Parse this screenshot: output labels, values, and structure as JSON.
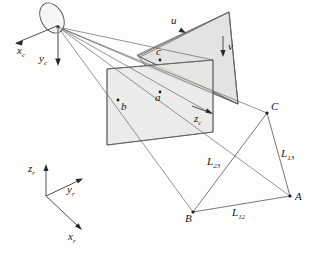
{
  "figure": {
    "background_color": "#fdfdfc",
    "line_color": "#57575d",
    "plane_fill_color": "#e2e2e0",
    "label_color": "#16161a"
  },
  "camera": {
    "lens_name": "camera-lens",
    "center_name": "camera-optical-center",
    "axes": [
      {
        "id": "xc",
        "base": "x",
        "sub": "c",
        "direction": "down-left"
      },
      {
        "id": "yc",
        "base": "y",
        "sub": "c",
        "direction": "down"
      },
      {
        "id": "zc",
        "base": "z",
        "sub": "c",
        "direction": "down-right"
      }
    ]
  },
  "image_plane": {
    "name": "image-plane",
    "axes": [
      {
        "id": "u",
        "base": "u",
        "sub": "",
        "direction": "down-right"
      },
      {
        "id": "v",
        "base": "v",
        "sub": "",
        "direction": "down"
      }
    ]
  },
  "projected_points": [
    {
      "id": "a",
      "label": "a",
      "plane": "near-plane"
    },
    {
      "id": "b",
      "label": "b",
      "plane": "near-plane"
    },
    {
      "id": "c",
      "label": "c",
      "plane": "near-plane"
    }
  ],
  "world_points": [
    {
      "id": "A",
      "label": "A"
    },
    {
      "id": "B",
      "label": "B"
    },
    {
      "id": "C",
      "label": "C"
    }
  ],
  "distances": [
    {
      "id": "L12",
      "base": "L",
      "sub": "12",
      "between": "B-A"
    },
    {
      "id": "L13",
      "base": "L",
      "sub": "13",
      "between": "C-A"
    },
    {
      "id": "L23",
      "base": "L",
      "sub": "23",
      "between": "B-C"
    }
  ],
  "world_frame": {
    "name": "world-reference-frame",
    "axes": [
      {
        "id": "xr",
        "base": "x",
        "sub": "r",
        "direction": "down-right"
      },
      {
        "id": "yr",
        "base": "y",
        "sub": "r",
        "direction": "up-right"
      },
      {
        "id": "zr",
        "base": "z",
        "sub": "r",
        "direction": "up"
      }
    ]
  }
}
